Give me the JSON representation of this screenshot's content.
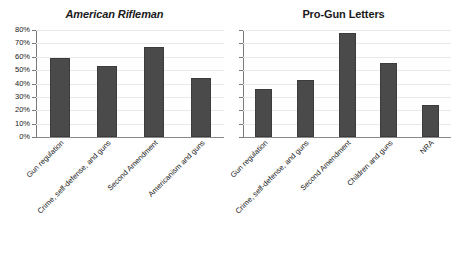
{
  "figure": {
    "background_color": "#ffffff",
    "bar_color": "#4a4a4a",
    "axis_color": "#7a7a7a",
    "grid_color": "#e9e9e9"
  },
  "chart_data": [
    {
      "type": "bar",
      "title": "American Rifleman",
      "title_style": "bold-italic",
      "categories": [
        "Gun regulation",
        "Crime, self-defense, and guns",
        "Second Amendment",
        "Americanism and guns"
      ],
      "values": [
        59,
        53,
        67,
        44
      ],
      "value_labels": [
        "59%",
        "53%",
        "67%",
        "44%"
      ],
      "xlabel": "",
      "ylabel": "",
      "ylim": [
        0,
        80
      ],
      "ytick_labels": [
        "0%",
        "10%",
        "20%",
        "30%",
        "40%",
        "50%",
        "60%",
        "70%",
        "80%"
      ],
      "ytick_values": [
        0,
        10,
        20,
        30,
        40,
        50,
        60,
        70,
        80
      ],
      "grid": true,
      "y_axis_visible": true,
      "legend": "none"
    },
    {
      "type": "bar",
      "title": "Pro-Gun Letters",
      "title_style": "bold",
      "categories": [
        "Gun regulation",
        "Crime, self-defense, and guns",
        "Second Amendment",
        "Children and guns",
        "NRA"
      ],
      "values": [
        36,
        43,
        78,
        55,
        24
      ],
      "value_labels": [
        "36%",
        "43%",
        "78%",
        "55%",
        "24%"
      ],
      "xlabel": "",
      "ylabel": "",
      "ylim": [
        0,
        80
      ],
      "ytick_labels": [],
      "ytick_values": [
        0,
        10,
        20,
        30,
        40,
        50,
        60,
        70,
        80
      ],
      "grid": true,
      "y_axis_visible": true,
      "legend": "none"
    }
  ]
}
